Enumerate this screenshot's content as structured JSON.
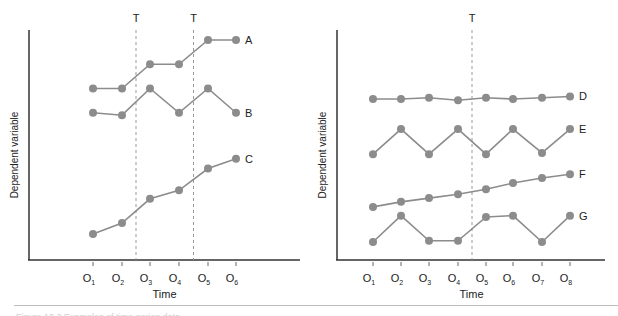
{
  "chart_data": [
    {
      "type": "line",
      "title": "",
      "xlabel": "Time",
      "ylabel": "Dependent variable",
      "categories": [
        "O1",
        "O2",
        "O3",
        "O4",
        "O5",
        "O6"
      ],
      "treatment_markers": [
        {
          "label": "T",
          "between": [
            "O2",
            "O3"
          ]
        },
        {
          "label": "T",
          "between": [
            "O4",
            "O5"
          ]
        }
      ],
      "grid": false,
      "legend": "inline labels at right end of each series",
      "series": [
        {
          "name": "A",
          "values": [
            7.0,
            7.0,
            8.0,
            8.0,
            9.0,
            9.0
          ]
        },
        {
          "name": "B",
          "values": [
            6.0,
            5.9,
            7.0,
            6.0,
            7.0,
            6.0
          ]
        },
        {
          "name": "C",
          "values": [
            1.0,
            1.45,
            2.45,
            2.8,
            3.7,
            4.1
          ]
        }
      ]
    },
    {
      "type": "line",
      "title": "",
      "xlabel": "Time",
      "ylabel": "Dependent variable",
      "categories": [
        "O1",
        "O2",
        "O3",
        "O4",
        "O5",
        "O6",
        "O7",
        "O8"
      ],
      "treatment_markers": [
        {
          "label": "T",
          "between": [
            "O4",
            "O5"
          ]
        }
      ],
      "grid": false,
      "legend": "inline labels at right end of each series",
      "series": [
        {
          "name": "D",
          "values": [
            7.0,
            7.0,
            7.05,
            6.95,
            7.05,
            7.0,
            7.05,
            7.1
          ]
        },
        {
          "name": "E",
          "values": [
            4.8,
            5.8,
            4.8,
            5.8,
            4.8,
            5.8,
            4.85,
            5.8
          ]
        },
        {
          "name": "F",
          "values": [
            2.7,
            2.9,
            3.05,
            3.2,
            3.4,
            3.65,
            3.85,
            4.0
          ]
        },
        {
          "name": "G",
          "values": [
            1.3,
            2.35,
            1.35,
            1.35,
            2.3,
            2.35,
            1.3,
            2.35
          ]
        }
      ]
    }
  ],
  "colors": {
    "series": "#8c8c8c",
    "axis": "#333333",
    "treatment_line": "#999999",
    "text": "#222222"
  },
  "labels": {
    "left": {
      "ylabel": "Dependent variable",
      "xlabel": "Time",
      "t1": "T",
      "t2": "T",
      "ticks": [
        "O1",
        "O2",
        "O3",
        "O4",
        "O5",
        "O6"
      ],
      "series": [
        "A",
        "B",
        "C"
      ]
    },
    "right": {
      "ylabel": "Dependent variable",
      "xlabel": "Time",
      "t1": "T",
      "ticks": [
        "O1",
        "O2",
        "O3",
        "O4",
        "O5",
        "O6",
        "O7",
        "O8"
      ],
      "series": [
        "D",
        "E",
        "F",
        "G"
      ]
    }
  },
  "caption": "Figure 10.3  Examples of time-series data"
}
